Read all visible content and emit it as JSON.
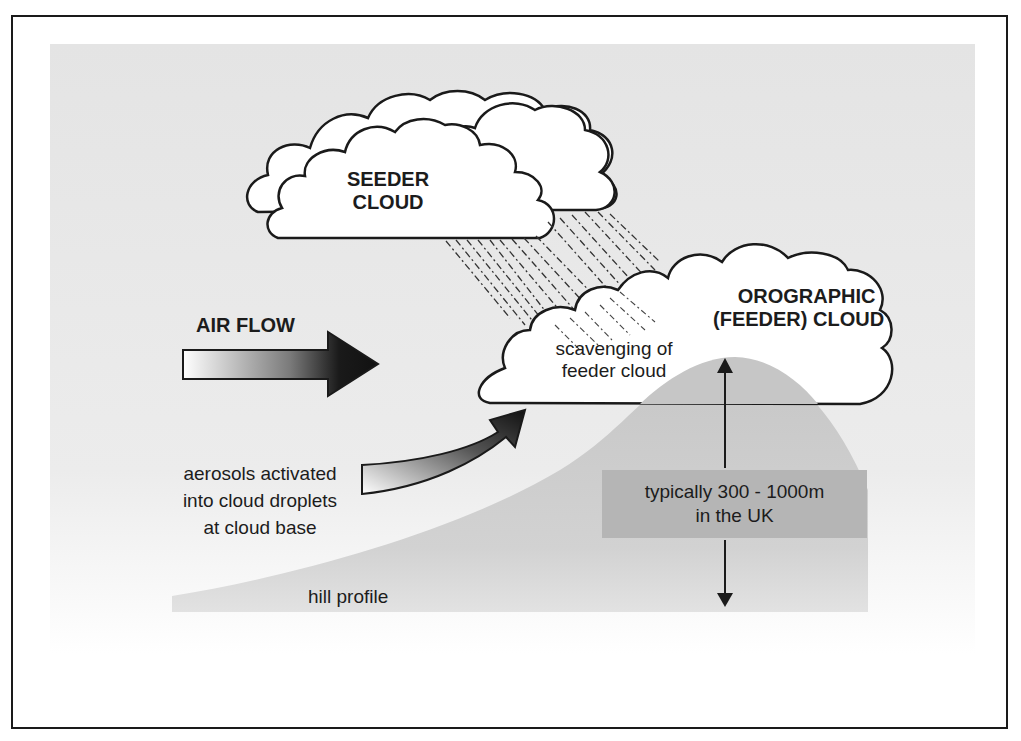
{
  "diagram": {
    "colors": {
      "background_panel": "#e6e6e6",
      "hill": "#c9c9c9",
      "height_label_box": "#b4b4b4",
      "outline": "#1a1a1a",
      "cloud_fill": "#ffffff"
    },
    "labels": {
      "seeder_cloud_line1": "SEEDER",
      "seeder_cloud_line2": "CLOUD",
      "orographic_line1": "OROGRAPHIC",
      "orographic_line2": "(FEEDER) CLOUD",
      "air_flow": "AIR FLOW",
      "scavenging_line1": "scavenging of",
      "scavenging_line2": "feeder cloud",
      "aerosols_line1": "aerosols activated",
      "aerosols_line2": "into cloud droplets",
      "aerosols_line3": "at cloud base",
      "height_line1": "typically 300 - 1000m",
      "height_line2": "in the UK",
      "hill_profile": "hill profile"
    },
    "nodes": [
      {
        "id": "seeder-cloud",
        "label": "SEEDER CLOUD"
      },
      {
        "id": "orographic-cloud",
        "label": "OROGRAPHIC (FEEDER) CLOUD"
      },
      {
        "id": "hill",
        "label": "hill profile"
      },
      {
        "id": "air-flow-arrow",
        "label": "AIR FLOW"
      },
      {
        "id": "aerosol-arrow",
        "label": "aerosols activated into cloud droplets at cloud base"
      },
      {
        "id": "height-arrow",
        "label": "typically 300 - 1000m in the UK"
      }
    ],
    "edges": [
      {
        "from": "seeder-cloud",
        "to": "orographic-cloud",
        "type": "precipitation",
        "label": "scavenging of feeder cloud"
      },
      {
        "from": "aerosol-arrow",
        "to": "orographic-cloud",
        "type": "curved-arrow"
      }
    ]
  }
}
